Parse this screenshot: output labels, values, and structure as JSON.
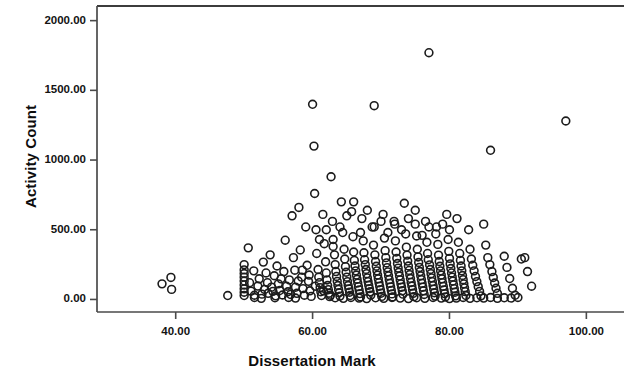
{
  "chart_data": {
    "type": "scatter",
    "title": "",
    "xlabel": "Dissertation Mark",
    "ylabel": "Activity Count",
    "xlim": [
      28.5,
      105.5
    ],
    "ylim": [
      -90,
      2105
    ],
    "xticks": [
      40,
      60,
      80,
      100
    ],
    "xtick_labels": [
      "40.00",
      "60.00",
      "80.00",
      "100.00"
    ],
    "yticks": [
      0,
      500,
      1000,
      1500,
      2000
    ],
    "ytick_labels": [
      "0.00",
      "500.00",
      "1000.00",
      "1500.00",
      "2000.00"
    ],
    "grid": false,
    "legend": null,
    "marker": "open-circle",
    "marker_color": "#1c1c1c",
    "n_points": 352,
    "points": [
      [
        38.0,
        112
      ],
      [
        39.3,
        158
      ],
      [
        39.4,
        72
      ],
      [
        47.6,
        28
      ],
      [
        50.0,
        250
      ],
      [
        50.0,
        212
      ],
      [
        50.0,
        186
      ],
      [
        50.0,
        160
      ],
      [
        50.0,
        132
      ],
      [
        50.0,
        104
      ],
      [
        50.0,
        76
      ],
      [
        50.0,
        52
      ],
      [
        50.0,
        28
      ],
      [
        50.6,
        370
      ],
      [
        50.8,
        120
      ],
      [
        51.0,
        60
      ],
      [
        51.4,
        205
      ],
      [
        51.5,
        30
      ],
      [
        52.0,
        96
      ],
      [
        52.2,
        148
      ],
      [
        52.6,
        38
      ],
      [
        52.8,
        268
      ],
      [
        53.0,
        72
      ],
      [
        53.2,
        190
      ],
      [
        53.4,
        120
      ],
      [
        53.5,
        44
      ],
      [
        53.8,
        320
      ],
      [
        54.0,
        88
      ],
      [
        54.2,
        58
      ],
      [
        54.4,
        170
      ],
      [
        54.6,
        26
      ],
      [
        54.8,
        240
      ],
      [
        55.0,
        112
      ],
      [
        55.2,
        64
      ],
      [
        55.4,
        148
      ],
      [
        55.6,
        32
      ],
      [
        55.8,
        200
      ],
      [
        56.0,
        425
      ],
      [
        56.2,
        95
      ],
      [
        56.4,
        55
      ],
      [
        56.6,
        140
      ],
      [
        56.8,
        36
      ],
      [
        57.0,
        600
      ],
      [
        57.2,
        300
      ],
      [
        57.4,
        210
      ],
      [
        57.5,
        88
      ],
      [
        57.7,
        44
      ],
      [
        57.9,
        132
      ],
      [
        58.0,
        660
      ],
      [
        58.2,
        355
      ],
      [
        58.4,
        160
      ],
      [
        58.6,
        78
      ],
      [
        58.8,
        30
      ],
      [
        59.0,
        520
      ],
      [
        59.2,
        245
      ],
      [
        59.4,
        130
      ],
      [
        59.6,
        62
      ],
      [
        59.8,
        22
      ],
      [
        60.0,
        1400
      ],
      [
        60.2,
        1100
      ],
      [
        60.3,
        760
      ],
      [
        60.5,
        500
      ],
      [
        60.6,
        330
      ],
      [
        60.8,
        215
      ],
      [
        60.9,
        160
      ],
      [
        61.0,
        120
      ],
      [
        61.1,
        85
      ],
      [
        61.2,
        55
      ],
      [
        61.3,
        28
      ],
      [
        61.5,
        610
      ],
      [
        61.7,
        400
      ],
      [
        61.9,
        270
      ],
      [
        62.0,
        190
      ],
      [
        62.1,
        140
      ],
      [
        62.2,
        100
      ],
      [
        62.3,
        70
      ],
      [
        62.4,
        45
      ],
      [
        62.5,
        20
      ],
      [
        62.7,
        880
      ],
      [
        62.9,
        560
      ],
      [
        63.0,
        430
      ],
      [
        63.2,
        320
      ],
      [
        63.3,
        250
      ],
      [
        63.4,
        200
      ],
      [
        63.5,
        165
      ],
      [
        63.6,
        130
      ],
      [
        63.7,
        100
      ],
      [
        63.8,
        72
      ],
      [
        63.9,
        48
      ],
      [
        64.0,
        24
      ],
      [
        64.2,
        700
      ],
      [
        64.4,
        480
      ],
      [
        64.6,
        360
      ],
      [
        64.7,
        290
      ],
      [
        64.8,
        235
      ],
      [
        64.9,
        195
      ],
      [
        65.0,
        160
      ],
      [
        65.1,
        128
      ],
      [
        65.2,
        100
      ],
      [
        65.3,
        76
      ],
      [
        65.4,
        52
      ],
      [
        65.5,
        28
      ],
      [
        65.7,
        630
      ],
      [
        65.9,
        450
      ],
      [
        66.0,
        340
      ],
      [
        66.1,
        280
      ],
      [
        66.2,
        240
      ],
      [
        66.3,
        205
      ],
      [
        66.4,
        175
      ],
      [
        66.5,
        145
      ],
      [
        66.6,
        118
      ],
      [
        66.7,
        92
      ],
      [
        66.8,
        68
      ],
      [
        66.9,
        42
      ],
      [
        67.0,
        18
      ],
      [
        67.2,
        580
      ],
      [
        67.4,
        420
      ],
      [
        67.5,
        335
      ],
      [
        67.6,
        285
      ],
      [
        67.7,
        250
      ],
      [
        67.8,
        215
      ],
      [
        67.9,
        185
      ],
      [
        68.0,
        155
      ],
      [
        68.1,
        128
      ],
      [
        68.2,
        102
      ],
      [
        68.3,
        78
      ],
      [
        68.4,
        55
      ],
      [
        68.5,
        30
      ],
      [
        68.7,
        520
      ],
      [
        68.9,
        390
      ],
      [
        69.0,
        1390
      ],
      [
        69.1,
        320
      ],
      [
        69.2,
        272
      ],
      [
        69.3,
        238
      ],
      [
        69.4,
        205
      ],
      [
        69.5,
        175
      ],
      [
        69.6,
        148
      ],
      [
        69.7,
        120
      ],
      [
        69.8,
        95
      ],
      [
        69.9,
        70
      ],
      [
        70.0,
        45
      ],
      [
        70.1,
        22
      ],
      [
        70.3,
        610
      ],
      [
        70.5,
        440
      ],
      [
        70.6,
        350
      ],
      [
        70.7,
        300
      ],
      [
        70.8,
        262
      ],
      [
        70.9,
        228
      ],
      [
        71.0,
        198
      ],
      [
        71.1,
        170
      ],
      [
        71.2,
        142
      ],
      [
        71.3,
        115
      ],
      [
        71.4,
        90
      ],
      [
        71.5,
        65
      ],
      [
        71.6,
        40
      ],
      [
        71.7,
        18
      ],
      [
        71.9,
        560
      ],
      [
        72.1,
        420
      ],
      [
        72.2,
        340
      ],
      [
        72.3,
        295
      ],
      [
        72.4,
        258
      ],
      [
        72.5,
        225
      ],
      [
        72.6,
        195
      ],
      [
        72.7,
        168
      ],
      [
        72.8,
        140
      ],
      [
        72.9,
        112
      ],
      [
        73.0,
        88
      ],
      [
        73.1,
        62
      ],
      [
        73.2,
        38
      ],
      [
        73.4,
        690
      ],
      [
        73.6,
        470
      ],
      [
        73.7,
        375
      ],
      [
        73.8,
        318
      ],
      [
        73.9,
        275
      ],
      [
        74.0,
        240
      ],
      [
        74.1,
        208
      ],
      [
        74.2,
        178
      ],
      [
        74.3,
        150
      ],
      [
        74.4,
        122
      ],
      [
        74.5,
        96
      ],
      [
        74.6,
        70
      ],
      [
        74.7,
        44
      ],
      [
        74.8,
        20
      ],
      [
        75.0,
        640
      ],
      [
        75.2,
        455
      ],
      [
        75.3,
        360
      ],
      [
        75.4,
        305
      ],
      [
        75.5,
        265
      ],
      [
        75.6,
        230
      ],
      [
        75.7,
        200
      ],
      [
        75.8,
        170
      ],
      [
        75.9,
        142
      ],
      [
        76.0,
        115
      ],
      [
        76.1,
        88
      ],
      [
        76.2,
        62
      ],
      [
        76.3,
        36
      ],
      [
        76.5,
        560
      ],
      [
        76.7,
        410
      ],
      [
        76.8,
        330
      ],
      [
        76.9,
        285
      ],
      [
        77.0,
        1770
      ],
      [
        77.1,
        248
      ],
      [
        77.2,
        215
      ],
      [
        77.3,
        185
      ],
      [
        77.4,
        155
      ],
      [
        77.5,
        128
      ],
      [
        77.6,
        100
      ],
      [
        77.7,
        74
      ],
      [
        77.8,
        48
      ],
      [
        77.9,
        24
      ],
      [
        78.1,
        520
      ],
      [
        78.3,
        395
      ],
      [
        78.4,
        318
      ],
      [
        78.5,
        272
      ],
      [
        78.6,
        238
      ],
      [
        78.7,
        205
      ],
      [
        78.8,
        175
      ],
      [
        78.9,
        148
      ],
      [
        79.0,
        120
      ],
      [
        79.1,
        94
      ],
      [
        79.2,
        68
      ],
      [
        79.3,
        42
      ],
      [
        79.4,
        18
      ],
      [
        79.6,
        610
      ],
      [
        79.8,
        430
      ],
      [
        79.9,
        345
      ],
      [
        80.0,
        295
      ],
      [
        80.1,
        255
      ],
      [
        80.2,
        222
      ],
      [
        80.3,
        190
      ],
      [
        80.4,
        160
      ],
      [
        80.5,
        132
      ],
      [
        80.6,
        105
      ],
      [
        80.7,
        78
      ],
      [
        80.8,
        52
      ],
      [
        80.9,
        26
      ],
      [
        81.1,
        580
      ],
      [
        81.3,
        410
      ],
      [
        81.5,
        330
      ],
      [
        81.6,
        280
      ],
      [
        81.7,
        240
      ],
      [
        81.8,
        205
      ],
      [
        81.9,
        172
      ],
      [
        82.0,
        142
      ],
      [
        82.1,
        112
      ],
      [
        82.2,
        84
      ],
      [
        82.3,
        56
      ],
      [
        82.4,
        28
      ],
      [
        82.8,
        500
      ],
      [
        83.0,
        360
      ],
      [
        83.2,
        290
      ],
      [
        83.4,
        245
      ],
      [
        83.6,
        205
      ],
      [
        83.8,
        165
      ],
      [
        84.0,
        128
      ],
      [
        84.2,
        92
      ],
      [
        84.4,
        58
      ],
      [
        84.6,
        26
      ],
      [
        85.0,
        540
      ],
      [
        85.3,
        390
      ],
      [
        85.6,
        300
      ],
      [
        85.9,
        250
      ],
      [
        86.0,
        1070
      ],
      [
        86.2,
        200
      ],
      [
        86.4,
        158
      ],
      [
        86.6,
        118
      ],
      [
        86.8,
        80
      ],
      [
        87.0,
        44
      ],
      [
        88.0,
        310
      ],
      [
        88.4,
        230
      ],
      [
        88.8,
        150
      ],
      [
        89.2,
        80
      ],
      [
        89.6,
        30
      ],
      [
        90.5,
        290
      ],
      [
        91.0,
        300
      ],
      [
        91.4,
        200
      ],
      [
        92.0,
        95
      ],
      [
        97.0,
        1280
      ],
      [
        61.0,
        430
      ],
      [
        62.0,
        500
      ],
      [
        63.0,
        380
      ],
      [
        64.0,
        520
      ],
      [
        65.0,
        600
      ],
      [
        66.0,
        700
      ],
      [
        67.0,
        480
      ],
      [
        68.0,
        640
      ],
      [
        69.0,
        520
      ],
      [
        70.0,
        560
      ],
      [
        71.0,
        480
      ],
      [
        72.0,
        540
      ],
      [
        73.0,
        500
      ],
      [
        74.0,
        580
      ],
      [
        75.0,
        540
      ],
      [
        76.0,
        460
      ],
      [
        77.0,
        520
      ],
      [
        78.0,
        470
      ],
      [
        79.0,
        540
      ],
      [
        80.0,
        500
      ],
      [
        58.5,
        210
      ],
      [
        59.5,
        175
      ],
      [
        60.4,
        95
      ],
      [
        61.6,
        62
      ],
      [
        62.6,
        30
      ],
      [
        63.3,
        12
      ],
      [
        64.5,
        8
      ],
      [
        65.6,
        14
      ],
      [
        66.8,
        10
      ],
      [
        67.9,
        6
      ],
      [
        69.2,
        12
      ],
      [
        70.4,
        8
      ],
      [
        71.6,
        14
      ],
      [
        72.8,
        10
      ],
      [
        74.0,
        6
      ],
      [
        75.2,
        12
      ],
      [
        76.4,
        8
      ],
      [
        77.6,
        14
      ],
      [
        78.8,
        10
      ],
      [
        80.0,
        6
      ],
      [
        56.5,
        14
      ],
      [
        57.5,
        10
      ],
      [
        54.5,
        12
      ],
      [
        52.5,
        8
      ],
      [
        51.5,
        14
      ],
      [
        81.0,
        10
      ],
      [
        82.0,
        14
      ],
      [
        83.0,
        8
      ],
      [
        84.0,
        12
      ],
      [
        85.0,
        10
      ],
      [
        86.0,
        14
      ],
      [
        87.0,
        8
      ],
      [
        88.0,
        12
      ],
      [
        89.0,
        10
      ],
      [
        90.0,
        14
      ]
    ]
  }
}
